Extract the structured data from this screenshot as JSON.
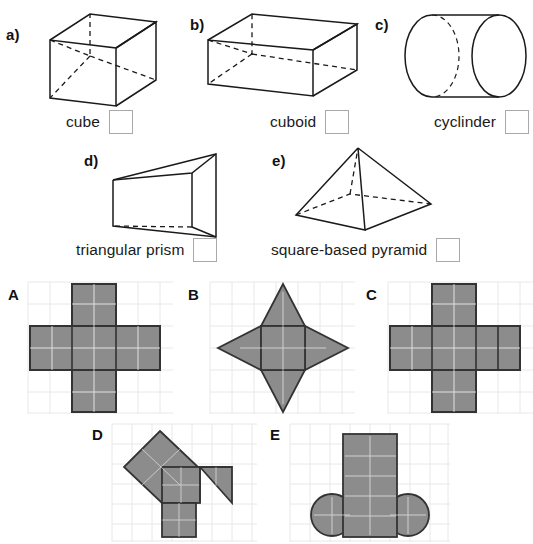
{
  "worksheet": {
    "title": "3D shapes and their nets matching exercise",
    "solid_items": [
      {
        "letter": "a)",
        "name": "cube",
        "answer": ""
      },
      {
        "letter": "b)",
        "name": "cuboid",
        "answer": ""
      },
      {
        "letter": "c)",
        "name": "cyclinder",
        "answer": ""
      },
      {
        "letter": "d)",
        "name": "triangular prism",
        "answer": ""
      },
      {
        "letter": "e)",
        "name": "square-based pyramid",
        "answer": ""
      }
    ],
    "net_items": [
      {
        "letter": "A",
        "description": "cube net, four squares in a row with one square above and one below"
      },
      {
        "letter": "B",
        "description": "square-based pyramid net, central square with four triangles forming a star"
      },
      {
        "letter": "C",
        "description": "cube net, cross shape with four squares in a row and one above and below"
      },
      {
        "letter": "D",
        "description": "triangular prism net, tilted square, rectangle, square and right triangle"
      },
      {
        "letter": "E",
        "description": "cylinder net, tall rectangle with a circle on each side"
      }
    ]
  },
  "style": {
    "shape_fill": "#8c8c8c",
    "shape_outline": "#333333",
    "grid_line": "#e2e2e2",
    "grid_line_inner": "#f0f0f0",
    "net_inner_line": "#ffffff",
    "box_border": "#a9a9a9",
    "line_color": "#1a1a1a"
  }
}
